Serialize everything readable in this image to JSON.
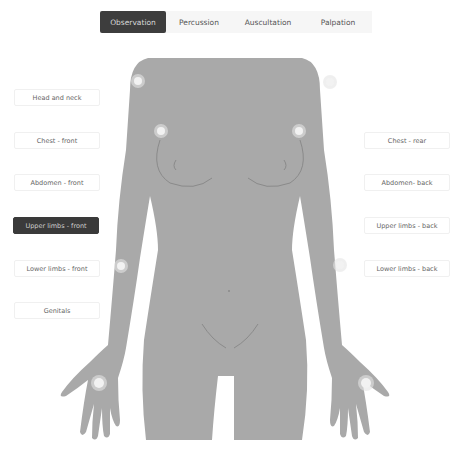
{
  "tabs": [
    {
      "label": "Observation",
      "active": true
    },
    {
      "label": "Percussion",
      "active": false
    },
    {
      "label": "Auscultation",
      "active": false
    },
    {
      "label": "Palpation",
      "active": false
    }
  ],
  "left_regions": [
    {
      "label": "Head and neck",
      "active": false
    },
    {
      "label": "Chest - front",
      "active": false
    },
    {
      "label": "Abdomen - front",
      "active": false
    },
    {
      "label": "Upper limbs - front",
      "active": true
    },
    {
      "label": "Lower limbs - front",
      "active": false
    },
    {
      "label": "Genitals",
      "active": false
    }
  ],
  "right_regions": [
    {
      "label": "Chest - rear",
      "active": false
    },
    {
      "label": "Abdomen- back",
      "active": false
    },
    {
      "label": "Upper limbs - back",
      "active": false
    },
    {
      "label": "Lower limbs - back",
      "active": false
    }
  ],
  "colors": {
    "body": "#a9a9a9",
    "active_bg": "#3a3a3a",
    "hotspot": "#e4e4e4"
  }
}
